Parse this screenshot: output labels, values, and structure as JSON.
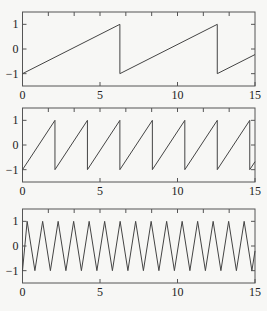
{
  "chart_data": [
    {
      "type": "line",
      "title": "",
      "xlabel": "",
      "ylabel": "",
      "waveform": "sawtooth",
      "period": 6.2832,
      "phase_start_value": -1,
      "xlim": [
        0,
        15
      ],
      "ylim": [
        -1.5,
        1.5
      ],
      "xticks": [
        0,
        5,
        10,
        15
      ],
      "xtick_labels": [
        "0",
        "5",
        "10",
        "15"
      ],
      "yticks": [
        1,
        0,
        -1
      ],
      "ytick_labels": [
        "1",
        "0",
        "−1"
      ],
      "grid": false,
      "series": [
        {
          "name": "sawtooth(t)",
          "x": [
            0,
            6.2832,
            6.2832,
            12.5664,
            12.5664,
            15
          ],
          "y": [
            -1,
            1,
            -1,
            1,
            -1,
            -0.226
          ]
        }
      ]
    },
    {
      "type": "line",
      "title": "",
      "xlabel": "",
      "ylabel": "",
      "waveform": "sawtooth",
      "period": 2.0944,
      "phase_start_value": -1,
      "xlim": [
        0,
        15
      ],
      "ylim": [
        -1.5,
        1.5
      ],
      "xticks": [
        0,
        5,
        10,
        15
      ],
      "xtick_labels": [
        "0",
        "5",
        "10",
        "15"
      ],
      "yticks": [
        1,
        0,
        -1
      ],
      "ytick_labels": [
        "1",
        "0",
        "−1"
      ],
      "grid": false,
      "series": [
        {
          "name": "sawtooth(3t)",
          "x": [
            0,
            2.094,
            2.094,
            4.189,
            4.189,
            6.283,
            6.283,
            8.378,
            8.378,
            10.472,
            10.472,
            12.566,
            12.566,
            14.661,
            14.661,
            15
          ],
          "y": [
            -1,
            1,
            -1,
            1,
            -1,
            1,
            -1,
            1,
            -1,
            1,
            -1,
            1,
            -1,
            1,
            -1,
            -0.676
          ]
        }
      ]
    },
    {
      "type": "line",
      "title": "",
      "xlabel": "",
      "ylabel": "",
      "waveform": "triangle",
      "period": 1.0,
      "first_peak": 0.3,
      "xlim": [
        0,
        15
      ],
      "ylim": [
        -1.5,
        1.5
      ],
      "xticks": [
        0,
        5,
        10,
        15
      ],
      "xtick_labels": [
        "0",
        "5",
        "10",
        "15"
      ],
      "yticks": [
        1,
        0,
        -1
      ],
      "ytick_labels": [
        "1",
        "0",
        "−1"
      ],
      "grid": false,
      "series": [
        {
          "name": "triangle(t)",
          "x": [],
          "y": []
        }
      ]
    }
  ],
  "layout": {
    "plots": [
      {
        "left": 22.5,
        "right": 255,
        "top": 12,
        "bottom": 86
      },
      {
        "left": 22.5,
        "right": 255,
        "top": 108,
        "bottom": 182
      },
      {
        "left": 22.5,
        "right": 255,
        "top": 209,
        "bottom": 283
      }
    ],
    "minor_xtick_step": 1.6667
  }
}
